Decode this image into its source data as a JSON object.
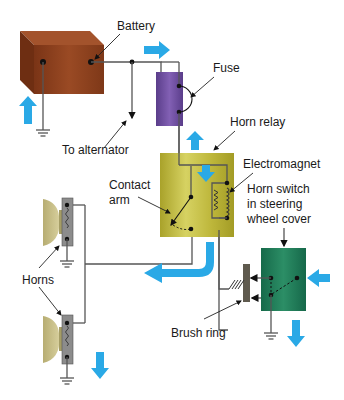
{
  "colors": {
    "battery": "#8a3e1c",
    "fuse": "#6a4a9a",
    "relay": "#c2bd3e",
    "horn_switch": "#1f7a58",
    "brush_ring": "#5f5a4e",
    "horn_body": "#8c8c8c",
    "horn_bell": "#c9c08a",
    "flow_arrow": "#2aa9e6",
    "wire": "#555555"
  },
  "labels": {
    "battery": "Battery",
    "to_alternator": "To alternator",
    "fuse": "Fuse",
    "horn_relay": "Horn relay",
    "electromagnet": "Electromagnet",
    "contact_arm_1": "Contact",
    "contact_arm_2": "arm",
    "horn_switch_1": "Horn switch",
    "horn_switch_2": "in steering",
    "horn_switch_3": "wheel cover",
    "horns": "Horns",
    "brush_ring": "Brush ring"
  },
  "components": [
    {
      "name": "battery",
      "type": "battery"
    },
    {
      "name": "fuse",
      "type": "fuse"
    },
    {
      "name": "horn_relay",
      "type": "relay",
      "contains": [
        "electromagnet",
        "contact_arm"
      ]
    },
    {
      "name": "horn_switch",
      "type": "switch"
    },
    {
      "name": "brush_ring",
      "type": "brush"
    },
    {
      "name": "horn_upper",
      "type": "horn"
    },
    {
      "name": "horn_lower",
      "type": "horn"
    }
  ],
  "flow_arrows": [
    {
      "location": "below battery",
      "direction": "up"
    },
    {
      "location": "battery to fuse",
      "direction": "right"
    },
    {
      "location": "below fuse",
      "direction": "up"
    },
    {
      "location": "inside relay",
      "direction": "down"
    },
    {
      "location": "below relay",
      "direction": "down-left"
    },
    {
      "location": "right of horn switch",
      "direction": "left"
    },
    {
      "location": "below horn switch",
      "direction": "down"
    },
    {
      "location": "below horns",
      "direction": "down"
    }
  ]
}
